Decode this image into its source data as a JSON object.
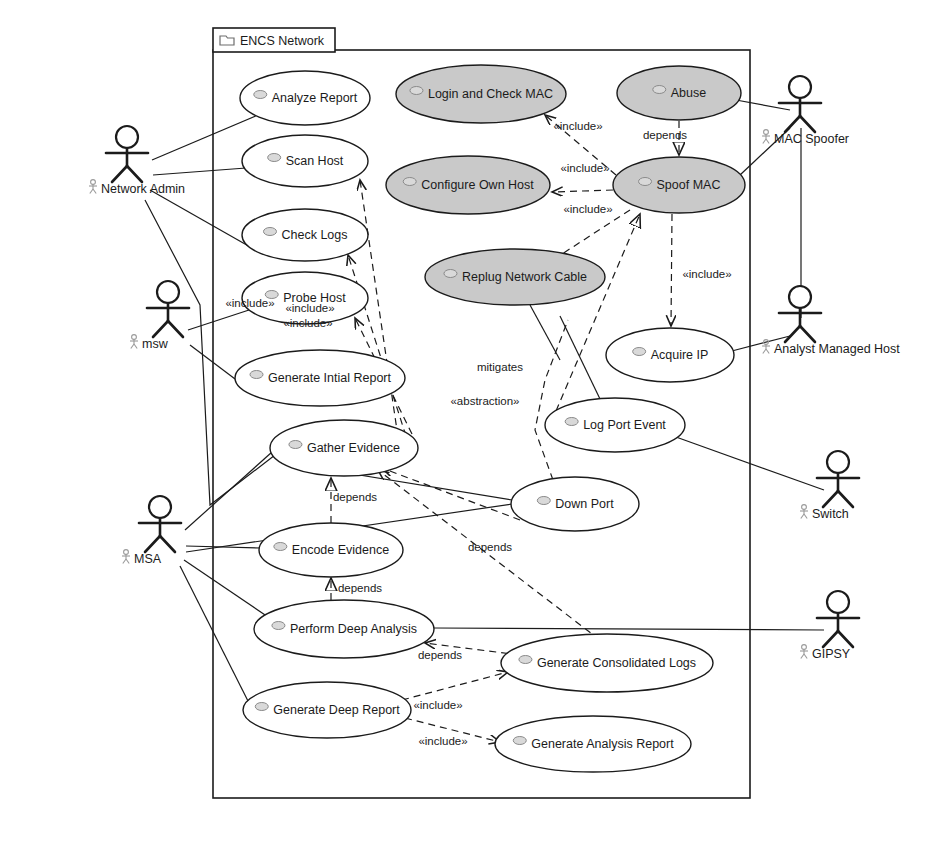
{
  "diagram": {
    "package_label": "ENCS Network",
    "package_icon": "folder-icon",
    "type": "uml-use-case-diagram"
  },
  "use_cases": [
    {
      "id": "analyze_report",
      "label": "Analyze Report",
      "shaded": false,
      "cx": 305,
      "cy": 98,
      "rx": 65,
      "ry": 27
    },
    {
      "id": "scan_host",
      "label": "Scan Host",
      "shaded": false,
      "cx": 305,
      "cy": 161,
      "rx": 63,
      "ry": 26
    },
    {
      "id": "check_logs",
      "label": "Check Logs",
      "shaded": false,
      "cx": 305,
      "cy": 235,
      "rx": 63,
      "ry": 26
    },
    {
      "id": "probe_host",
      "label": "Probe Host",
      "shaded": false,
      "cx": 305,
      "cy": 298,
      "rx": 63,
      "ry": 26
    },
    {
      "id": "generate_initial",
      "label": "Generate Intial Report",
      "shaded": false,
      "cx": 320,
      "cy": 378,
      "rx": 85,
      "ry": 28
    },
    {
      "id": "gather_evidence",
      "label": "Gather Evidence",
      "shaded": false,
      "cx": 344,
      "cy": 448,
      "rx": 74,
      "ry": 28
    },
    {
      "id": "encode_evidence",
      "label": "Encode Evidence",
      "shaded": false,
      "cx": 331,
      "cy": 550,
      "rx": 72,
      "ry": 27
    },
    {
      "id": "perform_deep",
      "label": "Perform Deep Analysis",
      "shaded": false,
      "cx": 344,
      "cy": 629,
      "rx": 90,
      "ry": 29
    },
    {
      "id": "generate_deep",
      "label": "Generate Deep Report",
      "shaded": false,
      "cx": 327,
      "cy": 710,
      "rx": 84,
      "ry": 28
    },
    {
      "id": "login_check_mac",
      "label": "Login and Check MAC",
      "shaded": true,
      "cx": 481,
      "cy": 94,
      "rx": 85,
      "ry": 29
    },
    {
      "id": "configure_own",
      "label": "Configure Own Host",
      "shaded": true,
      "cx": 468,
      "cy": 185,
      "rx": 82,
      "ry": 29
    },
    {
      "id": "replug_cable",
      "label": "Replug Network Cable",
      "shaded": true,
      "cx": 515,
      "cy": 277,
      "rx": 90,
      "ry": 28
    },
    {
      "id": "abuse",
      "label": "Abuse",
      "shaded": true,
      "cx": 679,
      "cy": 93,
      "rx": 62,
      "ry": 27
    },
    {
      "id": "spoof_mac",
      "label": "Spoof MAC",
      "shaded": true,
      "cx": 679,
      "cy": 185,
      "rx": 66,
      "ry": 28
    },
    {
      "id": "acquire_ip",
      "label": "Acquire IP",
      "shaded": false,
      "cx": 670,
      "cy": 355,
      "rx": 64,
      "ry": 27
    },
    {
      "id": "log_port_event",
      "label": "Log Port Event",
      "shaded": false,
      "cx": 615,
      "cy": 425,
      "rx": 70,
      "ry": 27
    },
    {
      "id": "down_port",
      "label": "Down Port",
      "shaded": false,
      "cx": 575,
      "cy": 504,
      "rx": 64,
      "ry": 27
    },
    {
      "id": "gen_consolidated",
      "label": "Generate Consolidated Logs",
      "shaded": false,
      "cx": 607,
      "cy": 663,
      "rx": 106,
      "ry": 29
    },
    {
      "id": "gen_analysis",
      "label": "Generate Analysis Report",
      "shaded": false,
      "cx": 593,
      "cy": 744,
      "rx": 98,
      "ry": 28
    }
  ],
  "actors": [
    {
      "id": "network_admin",
      "label": "Network Admin",
      "x": 127,
      "y": 175
    },
    {
      "id": "msw",
      "label": "msw",
      "x": 168,
      "y": 330
    },
    {
      "id": "msa",
      "label": "MSA",
      "x": 160,
      "y": 545
    },
    {
      "id": "mac_spoofer",
      "label": "MAC Spoofer",
      "x": 800,
      "y": 125
    },
    {
      "id": "analyst_managed_host",
      "label": "Analyst Managed Host",
      "x": 800,
      "y": 335
    },
    {
      "id": "switch",
      "label": "Switch",
      "x": 838,
      "y": 500
    },
    {
      "id": "gipsy",
      "label": "GIPSY",
      "x": 838,
      "y": 640
    }
  ],
  "edge_labels": [
    {
      "id": "inc_login",
      "text": "«include»",
      "x": 578,
      "y": 130
    },
    {
      "id": "depends_abuse",
      "text": "depends",
      "x": 665,
      "y": 139
    },
    {
      "id": "inc_config",
      "text": "«include»",
      "x": 585,
      "y": 172
    },
    {
      "id": "inc_replug",
      "text": "«include»",
      "x": 588,
      "y": 213
    },
    {
      "id": "inc_acquire",
      "text": "«include»",
      "x": 707,
      "y": 278
    },
    {
      "id": "inc_left_a",
      "text": "«include»",
      "x": 310,
      "y": 312
    },
    {
      "id": "inc_left_b",
      "text": "«include»",
      "x": 308,
      "y": 327
    },
    {
      "id": "inc_left_c",
      "text": "«include»",
      "x": 250,
      "y": 307
    },
    {
      "id": "mitigates",
      "text": "mitigates",
      "x": 500,
      "y": 371
    },
    {
      "id": "abstraction",
      "text": "«abstraction»",
      "x": 485,
      "y": 405
    },
    {
      "id": "depends_gather",
      "text": "depends",
      "x": 355,
      "y": 501
    },
    {
      "id": "depends_deep",
      "text": "depends",
      "x": 490,
      "y": 551
    },
    {
      "id": "depends_encode",
      "text": "depends",
      "x": 360,
      "y": 592
    },
    {
      "id": "depends_cons",
      "text": "depends",
      "x": 440,
      "y": 659
    },
    {
      "id": "inc_deep_a",
      "text": "«include»",
      "x": 438,
      "y": 709
    },
    {
      "id": "inc_deep_b",
      "text": "«include»",
      "x": 443,
      "y": 745
    }
  ],
  "frame": {
    "x": 213,
    "y": 50,
    "width": 537,
    "height": 748,
    "tab_width": 122,
    "tab_height": 24
  },
  "colors": {
    "shaded_fill": "#c9c9c9",
    "plain_fill": "#ffffff",
    "stroke": "#1b1b1b",
    "icon_fill": "#d9d9d9"
  }
}
